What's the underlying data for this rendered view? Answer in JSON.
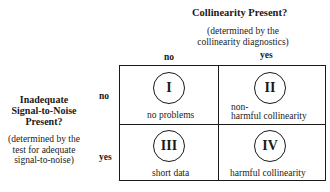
{
  "column_header": {
    "title": "Collinearity Present?",
    "note_line1": "(determined by the",
    "note_line2": "collinearity diagnostics)",
    "values": [
      "no",
      "yes"
    ]
  },
  "row_header": {
    "title_line1": "Inadequate",
    "title_line2": "Signal-to-Noise",
    "title_line3": "Present?",
    "note_line1": "(determined by the",
    "note_line2": "test for adequate",
    "note_line3": "signal-to-noise)",
    "values": [
      "no",
      "yes"
    ]
  },
  "cells": [
    {
      "numeral": "I",
      "label_line1": "no problems",
      "label_line2": ""
    },
    {
      "numeral": "II",
      "label_line1": "non-",
      "label_line2": "harmful collinearity"
    },
    {
      "numeral": "III",
      "label_line1": "short data",
      "label_line2": ""
    },
    {
      "numeral": "IV",
      "label_line1": "harmful collinearity",
      "label_line2": ""
    }
  ]
}
